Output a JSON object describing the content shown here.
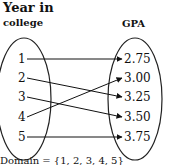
{
  "diagram": {
    "left_set": {
      "title_line1": "Year in",
      "title_line2": "college",
      "elements": [
        "1",
        "2",
        "3",
        "4",
        "5"
      ]
    },
    "right_set": {
      "title": "GPA",
      "elements": [
        "2.75",
        "3.00",
        "3.25",
        "3.50",
        "3.75"
      ]
    },
    "mapping": [
      {
        "from": "1",
        "to": "2.75"
      },
      {
        "from": "2",
        "to": "3.25"
      },
      {
        "from": "3",
        "to": "3.50"
      },
      {
        "from": "4",
        "to": "3.00"
      },
      {
        "from": "5",
        "to": "3.75"
      }
    ],
    "domain_label": "Domain = {1, 2, 3, 4, 5}"
  }
}
